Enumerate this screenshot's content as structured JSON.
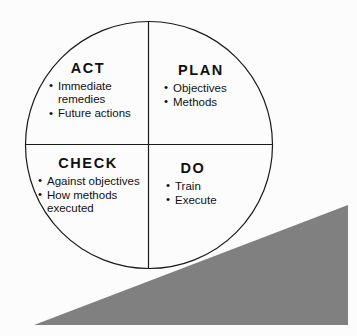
{
  "diagram": {
    "background_color": "#fcfcfc",
    "line_color": "#1a1a1a",
    "wedge_color": "#808080",
    "quadrants": [
      {
        "key": "act",
        "label": "ACT",
        "position": "upper-left",
        "items": [
          "Immediate\nremedies",
          "Future actions"
        ],
        "bullet": "•"
      },
      {
        "key": "plan",
        "label": "PLAN",
        "position": "upper-right",
        "items": [
          "Objectives",
          "Methods"
        ],
        "bullet": "•"
      },
      {
        "key": "check",
        "label": "CHECK",
        "position": "lower-left",
        "items": [
          "Against objectives",
          "How methods\nexecuted"
        ],
        "bullet": "•"
      },
      {
        "key": "do",
        "label": "DO",
        "position": "lower-right",
        "items": [
          "Train",
          "Execute"
        ],
        "bullet": "•"
      }
    ]
  }
}
